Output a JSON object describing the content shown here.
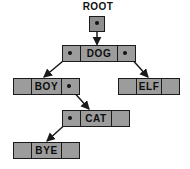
{
  "diagram": {
    "title_label": "ROOT",
    "root_pointer": {
      "icon": "pointer-dot-icon"
    },
    "nodes": [
      {
        "id": "dog",
        "value": "DOG",
        "left_pointer": "set",
        "right_pointer": "set",
        "left_icon": "pointer-dot-icon",
        "right_icon": "pointer-dot-icon"
      },
      {
        "id": "boy",
        "value": "BOY",
        "left_pointer": "null",
        "right_pointer": "set",
        "right_icon": "pointer-dot-icon"
      },
      {
        "id": "elf",
        "value": "ELF",
        "left_pointer": "null",
        "right_pointer": "null"
      },
      {
        "id": "cat",
        "value": "CAT",
        "left_pointer": "set",
        "right_pointer": "null",
        "left_icon": "pointer-dot-icon"
      },
      {
        "id": "bye",
        "value": "BYE",
        "left_pointer": "null",
        "right_pointer": "null"
      }
    ],
    "edges": [
      {
        "from": "root",
        "to": "dog",
        "kind": "vertical-arrow"
      },
      {
        "from": "dog-left",
        "to": "boy",
        "kind": "diagonal-arrow"
      },
      {
        "from": "dog-right",
        "to": "elf",
        "kind": "diagonal-arrow"
      },
      {
        "from": "boy-right",
        "to": "cat",
        "kind": "diagonal-arrow"
      },
      {
        "from": "cat-left",
        "to": "bye",
        "kind": "diagonal-arrow"
      }
    ],
    "colors": {
      "node_fill": "#9c9c9c",
      "stroke": "#1a1a1a",
      "text": "#0d0d0d",
      "background": "#ffffff"
    }
  }
}
